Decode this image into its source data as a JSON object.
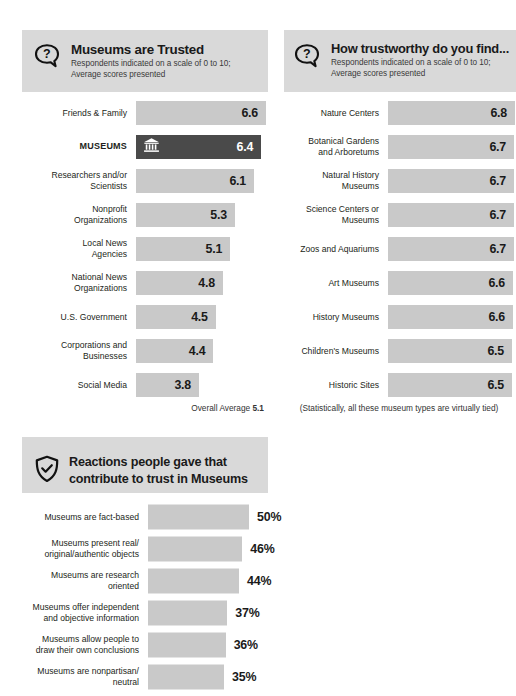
{
  "panels": {
    "trusted": {
      "icon": "question-bubble-icon",
      "title": "Museums are Trusted",
      "subtitle_line1": "Respondents indicated on a scale of 0 to 10;",
      "subtitle_line2": "Average scores presented",
      "footnote_prefix": "Overall Average ",
      "footnote_value": "5.1"
    },
    "trustworthy": {
      "icon": "question-bubble-icon",
      "title": "How trustworthy do you find...",
      "subtitle_line1": "Respondents indicated on a scale of 0 to 10;",
      "subtitle_line2": "Average scores presented",
      "footnote": "(Statistically, all these museum types are virtually tied)"
    },
    "reactions": {
      "icon": "shield-check-icon",
      "title_line1": "Reactions people gave that",
      "title_line2": "contribute to trust in Museums"
    }
  },
  "colors": {
    "bar": "#c9c9c9",
    "bar_highlight": "#4a4a4a",
    "header_band": "#d9d9d9",
    "text": "#231f20"
  },
  "chart_data": [
    {
      "type": "bar",
      "title": "Museums are Trusted",
      "xlabel": "",
      "ylabel": "",
      "xlim": [
        0,
        7.2
      ],
      "grid": false,
      "orientation": "horizontal",
      "value_suffix": "",
      "categories": [
        "Friends & Family",
        "MUSEUMS",
        "Researchers and/or Scientists",
        "Nonprofit Organizations",
        "Local News Agencies",
        "National News Organizations",
        "U.S. Government",
        "Corporations and Businesses",
        "Social Media"
      ],
      "values": [
        6.6,
        6.4,
        6.1,
        5.3,
        5.1,
        4.8,
        4.5,
        4.4,
        3.8
      ],
      "labels": [
        "6.6",
        "6.4",
        "6.1",
        "5.3",
        "5.1",
        "4.8",
        "4.5",
        "4.4",
        "3.8"
      ],
      "highlight_index": 1,
      "overall_average": 5.1
    },
    {
      "type": "bar",
      "title": "How trustworthy do you find...",
      "xlabel": "",
      "ylabel": "",
      "xlim": [
        0,
        7.0
      ],
      "grid": false,
      "orientation": "horizontal",
      "value_suffix": "",
      "categories": [
        "Nature Centers",
        "Botanical Gardens and Arboretums",
        "Natural History Museums",
        "Science Centers or Museums",
        "Zoos and Aquariums",
        "Art Museums",
        "History Museums",
        "Children's Museums",
        "Historic Sites"
      ],
      "values": [
        6.8,
        6.7,
        6.7,
        6.7,
        6.7,
        6.6,
        6.6,
        6.5,
        6.5
      ],
      "labels": [
        "6.8",
        "6.7",
        "6.7",
        "6.7",
        "6.7",
        "6.6",
        "6.6",
        "6.5",
        "6.5"
      ]
    },
    {
      "type": "bar",
      "title": "Reactions people gave that contribute to trust in Museums",
      "xlabel": "",
      "ylabel": "",
      "xlim": [
        0,
        55
      ],
      "grid": false,
      "orientation": "horizontal",
      "value_suffix": "%",
      "categories": [
        "Museums are fact-based",
        "Museums present real/ original/authentic objects",
        "Museums are research oriented",
        "Museums offer independent and objective information",
        "Museums allow people to draw their own conclusions",
        "Museums are nonpartisan/ neutral"
      ],
      "values": [
        50,
        46,
        44,
        37,
        36,
        35
      ],
      "labels": [
        "50%",
        "46%",
        "44%",
        "37%",
        "36%",
        "35%"
      ]
    }
  ],
  "rows_left": [
    {
      "label_line1": "Friends & Family",
      "label_line2": "",
      "value": "6.6"
    },
    {
      "label_line1": "MUSEUMS",
      "label_line2": "",
      "value": "6.4"
    },
    {
      "label_line1": "Researchers and/or",
      "label_line2": "Scientists",
      "value": "6.1"
    },
    {
      "label_line1": "Nonprofit",
      "label_line2": "Organizations",
      "value": "5.3"
    },
    {
      "label_line1": "Local News",
      "label_line2": "Agencies",
      "value": "5.1"
    },
    {
      "label_line1": "National News",
      "label_line2": "Organizations",
      "value": "4.8"
    },
    {
      "label_line1": "U.S. Government",
      "label_line2": "",
      "value": "4.5"
    },
    {
      "label_line1": "Corporations and",
      "label_line2": "Businesses",
      "value": "4.4"
    },
    {
      "label_line1": "Social Media",
      "label_line2": "",
      "value": "3.8"
    }
  ],
  "rows_right": [
    {
      "label_line1": "Nature Centers",
      "label_line2": "",
      "value": "6.8"
    },
    {
      "label_line1": "Botanical Gardens",
      "label_line2": "and Arboretums",
      "value": "6.7"
    },
    {
      "label_line1": "Natural History",
      "label_line2": "Museums",
      "value": "6.7"
    },
    {
      "label_line1": "Science Centers or",
      "label_line2": "Museums",
      "value": "6.7"
    },
    {
      "label_line1": "Zoos and Aquariums",
      "label_line2": "",
      "value": "6.7"
    },
    {
      "label_line1": "Art Museums",
      "label_line2": "",
      "value": "6.6"
    },
    {
      "label_line1": "History Museums",
      "label_line2": "",
      "value": "6.6"
    },
    {
      "label_line1": "Children's Museums",
      "label_line2": "",
      "value": "6.5"
    },
    {
      "label_line1": "Historic Sites",
      "label_line2": "",
      "value": "6.5"
    }
  ],
  "rows_bottom": [
    {
      "label_line1": "Museums are fact-based",
      "label_line2": "",
      "value": "50%"
    },
    {
      "label_line1": "Museums present real/",
      "label_line2": "original/authentic objects",
      "value": "46%"
    },
    {
      "label_line1": "Museums are research",
      "label_line2": "oriented",
      "value": "44%"
    },
    {
      "label_line1": "Museums offer independent",
      "label_line2": "and objective information",
      "value": "37%"
    },
    {
      "label_line1": "Museums allow people to",
      "label_line2": "draw their own conclusions",
      "value": "36%"
    },
    {
      "label_line1": "Museums are nonpartisan/",
      "label_line2": "neutral",
      "value": "35%"
    }
  ]
}
